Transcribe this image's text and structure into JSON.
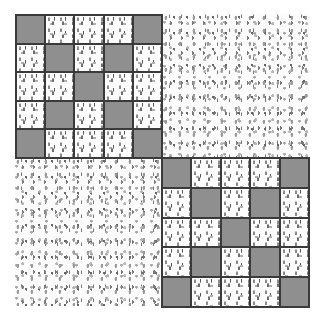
{
  "image": {
    "description": "Quilt-style drawing: two 5x5 checkered blocks (top-left and bottom-right) alternating with two plain floral-print squares (top-right and bottom-left)",
    "colors": {
      "dark_square": "#8f8f8f",
      "light_background": "#fcfcfc",
      "grid_line": "#3a3a3a",
      "page": "#ffffff"
    },
    "quadrants": [
      {
        "position": "top-left",
        "type": "checkered-block",
        "rows": 5,
        "cols": 5
      },
      {
        "position": "top-right",
        "type": "floral-print"
      },
      {
        "position": "bottom-left",
        "type": "floral-print"
      },
      {
        "position": "bottom-right",
        "type": "checkered-block",
        "rows": 5,
        "cols": 5
      }
    ],
    "block_pattern": [
      [
        1,
        0,
        0,
        0,
        1
      ],
      [
        0,
        1,
        0,
        1,
        0
      ],
      [
        0,
        0,
        1,
        0,
        0
      ],
      [
        0,
        1,
        0,
        1,
        0
      ],
      [
        1,
        0,
        0,
        0,
        1
      ]
    ]
  }
}
